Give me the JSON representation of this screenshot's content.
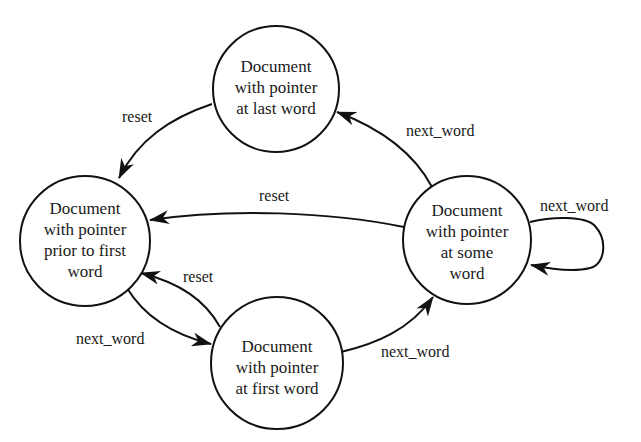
{
  "diagram": {
    "type": "state-transition",
    "states": {
      "prior": {
        "lines": [
          "Document",
          "with pointer",
          "prior to first",
          "word"
        ]
      },
      "last": {
        "lines": [
          "Document",
          "with pointer",
          "at last word"
        ]
      },
      "some": {
        "lines": [
          "Document",
          "with pointer",
          "at some",
          "word"
        ]
      },
      "first": {
        "lines": [
          "Document",
          "with pointer",
          "at first word"
        ]
      }
    },
    "transitions": {
      "last_to_prior": {
        "label": "reset",
        "from": "last",
        "to": "prior"
      },
      "some_to_last": {
        "label": "next_word",
        "from": "some",
        "to": "last"
      },
      "some_to_prior": {
        "label": "reset",
        "from": "some",
        "to": "prior"
      },
      "some_to_some": {
        "label": "next_word",
        "from": "some",
        "to": "some"
      },
      "first_to_prior": {
        "label": "reset",
        "from": "first",
        "to": "prior"
      },
      "prior_to_first": {
        "label": "next_word",
        "from": "prior",
        "to": "first"
      },
      "first_to_some": {
        "label": "next_word",
        "from": "first",
        "to": "some"
      }
    }
  }
}
